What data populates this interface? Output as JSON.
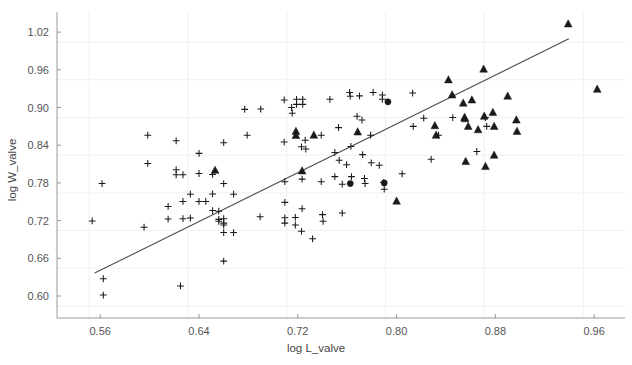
{
  "chart_data": {
    "type": "scatter",
    "title": "",
    "xlabel": "log L_valve",
    "ylabel": "log W_valve",
    "xlim": [
      0.525,
      0.985
    ],
    "ylim": [
      0.565,
      1.052
    ],
    "xticks": [
      0.56,
      0.64,
      0.72,
      0.8,
      0.88,
      0.96
    ],
    "xtick_labels": [
      "0.56",
      "0.64",
      "0.72",
      "0.80",
      "0.88",
      "0.96"
    ],
    "yticks": [
      0.6,
      0.66,
      0.72,
      0.78,
      0.84,
      0.9,
      0.96,
      1.02
    ],
    "ytick_labels": [
      "0.60",
      "0.66",
      "0.72",
      "0.78",
      "0.84",
      "0.90",
      "0.96",
      "1.02"
    ],
    "grid": true,
    "legend": "none",
    "colors": {
      "marker": "#1a1a1a",
      "grid": "#f0f0f0",
      "axis": "#999999",
      "trendline": "#4d4d4d",
      "tick_text": "#555555",
      "background": "#ffffff"
    },
    "trendline": {
      "type": "linear",
      "x_start": 0.5555,
      "y_start": 0.6365,
      "x_end": 0.9395,
      "y_end": 1.0095
    },
    "series": [
      {
        "name": "plus",
        "marker": "plus",
        "points": [
          [
            0.5615,
            0.779
          ],
          [
            0.5625,
            0.6275
          ],
          [
            0.5625,
            0.6015
          ],
          [
            0.5535,
            0.7195
          ],
          [
            0.5955,
            0.7095
          ],
          [
            0.5985,
            0.856
          ],
          [
            0.5985,
            0.811
          ],
          [
            0.615,
            0.7425
          ],
          [
            0.615,
            0.7225
          ],
          [
            0.6215,
            0.847
          ],
          [
            0.6215,
            0.801
          ],
          [
            0.6215,
            0.793
          ],
          [
            0.627,
            0.793
          ],
          [
            0.627,
            0.7505
          ],
          [
            0.627,
            0.723
          ],
          [
            0.625,
            0.616
          ],
          [
            0.633,
            0.762
          ],
          [
            0.633,
            0.724
          ],
          [
            0.64,
            0.827
          ],
          [
            0.64,
            0.795
          ],
          [
            0.64,
            0.7505
          ],
          [
            0.6455,
            0.7505
          ],
          [
            0.651,
            0.7625
          ],
          [
            0.651,
            0.736
          ],
          [
            0.651,
            0.7935
          ],
          [
            0.656,
            0.735
          ],
          [
            0.656,
            0.722
          ],
          [
            0.656,
            0.719
          ],
          [
            0.66,
            0.844
          ],
          [
            0.66,
            0.779
          ],
          [
            0.66,
            0.723
          ],
          [
            0.66,
            0.716
          ],
          [
            0.66,
            0.701
          ],
          [
            0.66,
            0.713
          ],
          [
            0.66,
            0.6555
          ],
          [
            0.668,
            0.762
          ],
          [
            0.668,
            0.701
          ],
          [
            0.677,
            0.897
          ],
          [
            0.679,
            0.856
          ],
          [
            0.6895,
            0.726
          ],
          [
            0.69,
            0.8975
          ],
          [
            0.709,
            0.912
          ],
          [
            0.709,
            0.845
          ],
          [
            0.7095,
            0.782
          ],
          [
            0.7095,
            0.749
          ],
          [
            0.7095,
            0.7245
          ],
          [
            0.7095,
            0.716
          ],
          [
            0.715,
            0.9
          ],
          [
            0.7155,
            0.891
          ],
          [
            0.718,
            0.725
          ],
          [
            0.718,
            0.713
          ],
          [
            0.719,
            0.913
          ],
          [
            0.719,
            0.905
          ],
          [
            0.723,
            0.8375
          ],
          [
            0.7235,
            0.786
          ],
          [
            0.7235,
            0.739
          ],
          [
            0.723,
            0.703
          ],
          [
            0.724,
            0.913
          ],
          [
            0.724,
            0.905
          ],
          [
            0.726,
            0.848
          ],
          [
            0.7265,
            0.834
          ],
          [
            0.732,
            0.691
          ],
          [
            0.739,
            0.856
          ],
          [
            0.739,
            0.782
          ],
          [
            0.74,
            0.7295
          ],
          [
            0.7405,
            0.719
          ],
          [
            0.746,
            0.913
          ],
          [
            0.75,
            0.8285
          ],
          [
            0.75,
            0.79
          ],
          [
            0.753,
            0.868
          ],
          [
            0.7535,
            0.816
          ],
          [
            0.756,
            0.778
          ],
          [
            0.756,
            0.732
          ],
          [
            0.7595,
            0.809
          ],
          [
            0.762,
            0.924
          ],
          [
            0.7625,
            0.918
          ],
          [
            0.763,
            0.838
          ],
          [
            0.7635,
            0.79
          ],
          [
            0.768,
            0.886
          ],
          [
            0.77,
            0.9185
          ],
          [
            0.772,
            0.88
          ],
          [
            0.7725,
            0.825
          ],
          [
            0.774,
            0.787
          ],
          [
            0.7745,
            0.779
          ],
          [
            0.779,
            0.856
          ],
          [
            0.7795,
            0.812
          ],
          [
            0.781,
            0.924
          ],
          [
            0.786,
            0.808
          ],
          [
            0.7885,
            0.92
          ],
          [
            0.7885,
            0.913
          ],
          [
            0.7895,
            0.7805
          ],
          [
            0.79,
            0.77
          ],
          [
            0.8045,
            0.7945
          ],
          [
            0.813,
            0.923
          ],
          [
            0.8135,
            0.87
          ],
          [
            0.822,
            0.883
          ],
          [
            0.828,
            0.8175
          ],
          [
            0.834,
            0.856
          ],
          [
            0.8455,
            0.884
          ],
          [
            0.865,
            0.83
          ],
          [
            0.872,
            0.884
          ],
          [
            0.873,
            0.87
          ]
        ]
      },
      {
        "name": "triangle",
        "marker": "triangle",
        "points": [
          [
            0.653,
            0.8
          ],
          [
            0.7185,
            0.862
          ],
          [
            0.7185,
            0.8555
          ],
          [
            0.733,
            0.856
          ],
          [
            0.7235,
            0.799
          ],
          [
            0.7685,
            0.861
          ],
          [
            0.8,
            0.751
          ],
          [
            0.831,
            0.871
          ],
          [
            0.832,
            0.856
          ],
          [
            0.842,
            0.944
          ],
          [
            0.845,
            0.92
          ],
          [
            0.854,
            0.907
          ],
          [
            0.855,
            0.884
          ],
          [
            0.8555,
            0.882
          ],
          [
            0.856,
            0.814
          ],
          [
            0.858,
            0.87
          ],
          [
            0.861,
            0.912
          ],
          [
            0.866,
            0.8645
          ],
          [
            0.8705,
            0.961
          ],
          [
            0.871,
            0.886
          ],
          [
            0.872,
            0.806
          ],
          [
            0.878,
            0.892
          ],
          [
            0.879,
            0.824
          ],
          [
            0.879,
            0.87
          ],
          [
            0.89,
            0.918
          ],
          [
            0.897,
            0.88
          ],
          [
            0.8975,
            0.862
          ],
          [
            0.939,
            1.033
          ],
          [
            0.9625,
            0.929
          ]
        ]
      },
      {
        "name": "circle",
        "marker": "circle",
        "points": [
          [
            0.7625,
            0.779
          ],
          [
            0.79,
            0.78
          ],
          [
            0.793,
            0.909
          ]
        ]
      }
    ]
  },
  "axes": {
    "x_axis_name": "log L_valve",
    "y_axis_name": "log W_valve"
  }
}
